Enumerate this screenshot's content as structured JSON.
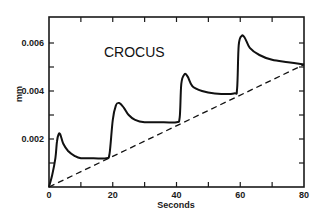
{
  "chart_data": {
    "type": "line",
    "title": "CROCUS",
    "xlabel": "Seconds",
    "ylabel": "mm",
    "xlim": [
      0,
      80
    ],
    "ylim": [
      0,
      0.006
    ],
    "x_ticks": [
      0,
      20,
      40,
      60,
      80
    ],
    "x_tick_labels": [
      "0",
      "20",
      "40",
      "60",
      "80"
    ],
    "y_ticks": [
      0.002,
      0.004,
      0.006
    ],
    "y_tick_labels": [
      "0.002",
      "0.004",
      "0.006"
    ],
    "grid": false,
    "legend": null,
    "series": [
      {
        "name": "response",
        "style": "solid",
        "points": [
          [
            0,
            0
          ],
          [
            1,
            0.0005
          ],
          [
            2,
            0.0012
          ],
          [
            2.5,
            0.0019
          ],
          [
            3,
            0.0022
          ],
          [
            3.5,
            0.0022
          ],
          [
            4.5,
            0.0018
          ],
          [
            6,
            0.0015
          ],
          [
            8,
            0.0013
          ],
          [
            10,
            0.0012
          ],
          [
            14,
            0.0012
          ],
          [
            18,
            0.0012
          ],
          [
            19,
            0.0014
          ],
          [
            20,
            0.0028
          ],
          [
            21,
            0.0034
          ],
          [
            22,
            0.0035
          ],
          [
            23.5,
            0.0033
          ],
          [
            25,
            0.003
          ],
          [
            27,
            0.0028
          ],
          [
            30,
            0.0027
          ],
          [
            36,
            0.0027
          ],
          [
            40,
            0.0027
          ],
          [
            41,
            0.0029
          ],
          [
            41.5,
            0.0043
          ],
          [
            42.5,
            0.0047
          ],
          [
            43.5,
            0.0046
          ],
          [
            45,
            0.0042
          ],
          [
            48,
            0.004
          ],
          [
            52,
            0.0039
          ],
          [
            58,
            0.0039
          ],
          [
            59,
            0.0041
          ],
          [
            59.5,
            0.0059
          ],
          [
            60.5,
            0.0063
          ],
          [
            61.5,
            0.0062
          ],
          [
            63,
            0.0058
          ],
          [
            66,
            0.0055
          ],
          [
            70,
            0.0053
          ],
          [
            75,
            0.0052
          ],
          [
            80,
            0.0051
          ]
        ]
      },
      {
        "name": "linear reference",
        "style": "dashed",
        "points": [
          [
            0,
            0
          ],
          [
            80,
            0.0051
          ]
        ]
      }
    ]
  }
}
